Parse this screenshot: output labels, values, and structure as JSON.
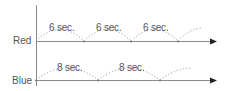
{
  "diagram": {
    "type": "timing-diagram",
    "axis_color": "#888888",
    "dot_color": "#999999",
    "text_color": "#555555",
    "rows": [
      {
        "label": "Red",
        "interval_label": "6 sec.",
        "interval_seconds": 6,
        "baseline_y": 41,
        "valleys_x": [
          36,
          84,
          131,
          178
        ],
        "labels": [
          "6 sec.",
          "6 sec.",
          "6 sec."
        ]
      },
      {
        "label": "Blue",
        "interval_label": "8 sec.",
        "interval_seconds": 8,
        "baseline_y": 80,
        "valleys_x": [
          36,
          98,
          160
        ],
        "labels": [
          "8 sec.",
          "8 sec."
        ]
      }
    ]
  }
}
